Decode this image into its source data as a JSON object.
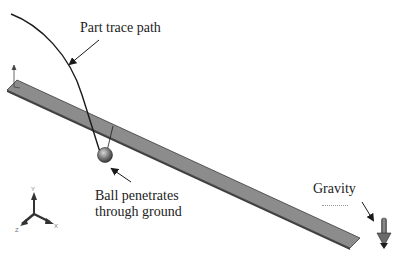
{
  "figure": {
    "annotations": {
      "part_trace_path": "Part trace path",
      "ball_line1": "Ball penetrates",
      "ball_line2": "through ground",
      "gravity": "Gravity"
    },
    "triad": {
      "x_label": "X",
      "y_label": "Y",
      "z_label": "Z"
    },
    "colors": {
      "plate_fill": "#8a8a8a",
      "plate_edge": "#3a3a3a",
      "trace_path": "#1a1a1a",
      "ball": "#7a7a7a",
      "gravity_arrow": "#555555",
      "background": "#ffffff"
    }
  }
}
